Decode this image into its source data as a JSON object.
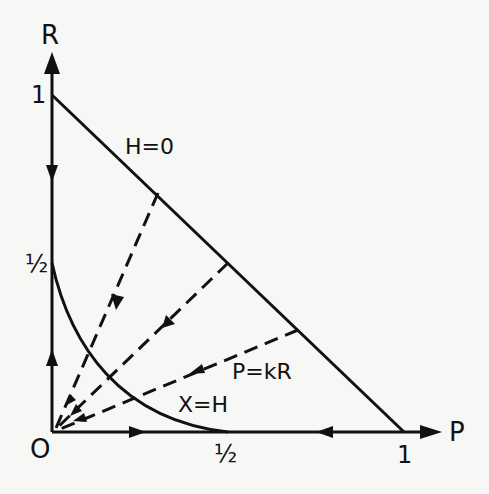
{
  "diagram": {
    "axes": {
      "x": {
        "label": "P",
        "ticks": [
          "0",
          "1/2",
          "1"
        ]
      },
      "y": {
        "label": "R",
        "ticks": [
          "0",
          "1/2",
          "1"
        ]
      },
      "origin_label": "O"
    },
    "labels": {
      "origin": "O",
      "r_axis": "R",
      "p_axis": "P",
      "r_one": "1",
      "r_half": "½",
      "p_half": "½",
      "p_one": "1",
      "hypotenuse": "H=0",
      "dashed_family": "P=kR",
      "curve": "X=H"
    },
    "elements": [
      {
        "type": "line",
        "name": "H=0",
        "from": [
          0,
          1
        ],
        "to": [
          1,
          0
        ],
        "style": "solid"
      },
      {
        "type": "curve",
        "name": "X=H",
        "from": [
          0,
          0.5
        ],
        "to": [
          0.5,
          0
        ],
        "style": "solid"
      },
      {
        "type": "ray-family",
        "name": "P=kR",
        "style": "dashed",
        "endpoints_on_H0": [
          [
            0.3,
            0.7
          ],
          [
            0.5,
            0.5
          ],
          [
            0.7,
            0.3
          ]
        ],
        "direction": "toward origin"
      }
    ],
    "colors": {
      "ink": "#111111",
      "paper": "#f7f7f5"
    }
  }
}
